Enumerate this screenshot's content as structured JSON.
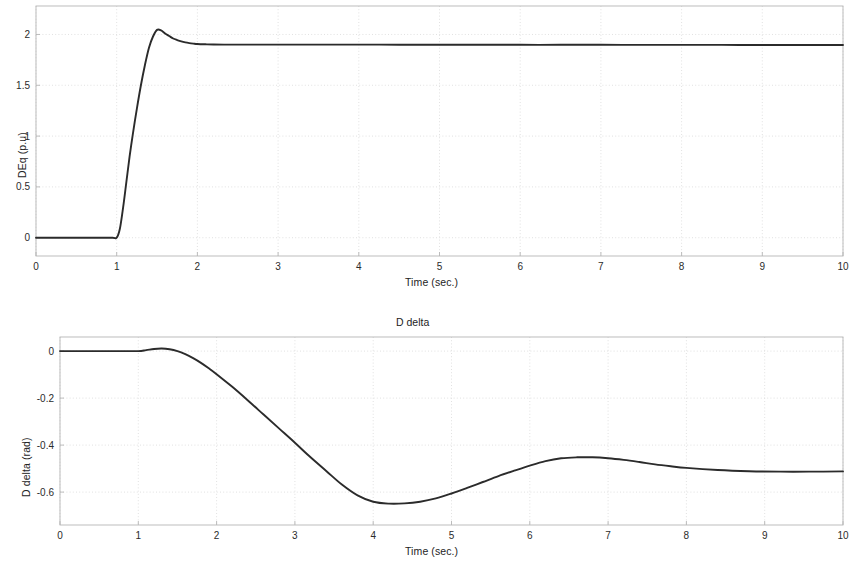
{
  "figure": {
    "background_color": "#ffffff",
    "line_color": "#2b2b2b",
    "grid_color": "#d9d9d9",
    "axis_color": "#b5b5b5"
  },
  "chart_data": [
    {
      "type": "line",
      "id": "deq-plot",
      "title": "",
      "xlabel": "Time (sec.)",
      "ylabel": "DEq (p.u)",
      "xlim": [
        0,
        10
      ],
      "ylim": [
        -0.18,
        2.28
      ],
      "xticks": [
        0,
        1,
        2,
        3,
        4,
        5,
        6,
        7,
        8,
        9,
        10
      ],
      "xtick_labels": [
        "0",
        "1",
        "2",
        "3",
        "4",
        "5",
        "6",
        "7",
        "8",
        "9",
        "10"
      ],
      "yticks": [
        0,
        0.5,
        1,
        1.5,
        2
      ],
      "ytick_labels": [
        "0",
        "0.5",
        "1",
        "1.5",
        "2"
      ],
      "grid": true,
      "legend": null,
      "series": [
        {
          "name": "DEq",
          "x": [
            0,
            0.2,
            0.4,
            0.6,
            0.8,
            0.95,
            1.0,
            1.04,
            1.08,
            1.12,
            1.16,
            1.2,
            1.25,
            1.3,
            1.35,
            1.4,
            1.45,
            1.5,
            1.55,
            1.6,
            1.65,
            1.7,
            1.75,
            1.8,
            1.85,
            1.9,
            1.95,
            2.0,
            2.1,
            2.2,
            2.4,
            2.6,
            2.8,
            3.0,
            3.5,
            4.0,
            4.5,
            5.0,
            5.5,
            6.0,
            6.5,
            7.0,
            7.5,
            8.0,
            8.5,
            9.0,
            9.5,
            10.0
          ],
          "y": [
            0.0,
            0.0,
            0.0,
            0.0,
            0.0,
            0.0,
            0.0,
            0.09,
            0.3,
            0.55,
            0.8,
            1.02,
            1.27,
            1.5,
            1.7,
            1.87,
            1.98,
            2.045,
            2.04,
            2.01,
            1.985,
            1.96,
            1.945,
            1.932,
            1.922,
            1.915,
            1.91,
            1.906,
            1.903,
            1.901,
            1.9,
            1.9,
            1.9,
            1.9,
            1.9,
            1.9,
            1.899,
            1.899,
            1.899,
            1.898,
            1.898,
            1.898,
            1.897,
            1.897,
            1.897,
            1.896,
            1.896,
            1.896
          ]
        }
      ]
    },
    {
      "type": "line",
      "id": "ddelta-plot",
      "title": "D delta",
      "xlabel": "Time (sec.)",
      "ylabel": "D delta (rad)",
      "xlim": [
        0,
        10
      ],
      "ylim": [
        -0.74,
        0.06
      ],
      "xticks": [
        0,
        1,
        2,
        3,
        4,
        5,
        6,
        7,
        8,
        9,
        10
      ],
      "xtick_labels": [
        "0",
        "1",
        "2",
        "3",
        "4",
        "5",
        "6",
        "7",
        "8",
        "9",
        "10"
      ],
      "yticks": [
        0,
        -0.2,
        -0.4,
        -0.6
      ],
      "ytick_labels": [
        "0",
        "-0.2",
        "-0.4",
        "-0.6"
      ],
      "grid": true,
      "legend": null,
      "series": [
        {
          "name": "D delta",
          "x": [
            0,
            0.2,
            0.4,
            0.6,
            0.8,
            1.0,
            1.1,
            1.2,
            1.3,
            1.4,
            1.5,
            1.6,
            1.7,
            1.8,
            1.9,
            2.0,
            2.2,
            2.4,
            2.6,
            2.8,
            3.0,
            3.2,
            3.4,
            3.6,
            3.8,
            4.0,
            4.2,
            4.4,
            4.6,
            4.8,
            5.0,
            5.2,
            5.4,
            5.6,
            5.8,
            6.0,
            6.2,
            6.4,
            6.6,
            6.8,
            7.0,
            7.2,
            7.4,
            7.6,
            7.8,
            8.0,
            8.4,
            8.8,
            9.2,
            9.6,
            10.0
          ],
          "y": [
            0.0,
            0.0,
            0.0,
            0.0,
            0.0,
            0.0,
            0.004,
            0.009,
            0.011,
            0.008,
            0.0,
            -0.013,
            -0.03,
            -0.05,
            -0.073,
            -0.098,
            -0.152,
            -0.21,
            -0.27,
            -0.33,
            -0.39,
            -0.452,
            -0.51,
            -0.568,
            -0.614,
            -0.641,
            -0.649,
            -0.648,
            -0.641,
            -0.627,
            -0.606,
            -0.582,
            -0.557,
            -0.532,
            -0.509,
            -0.487,
            -0.468,
            -0.456,
            -0.452,
            -0.452,
            -0.456,
            -0.463,
            -0.472,
            -0.482,
            -0.49,
            -0.497,
            -0.506,
            -0.511,
            -0.513,
            -0.513,
            -0.512
          ]
        }
      ]
    }
  ]
}
